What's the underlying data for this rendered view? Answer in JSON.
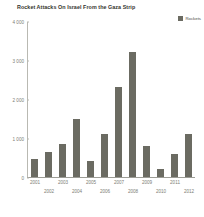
{
  "chart_data": {
    "type": "bar",
    "title": "Rocket Attacks On Israel From the Gaza Strip",
    "xlabel": "",
    "ylabel": "",
    "categories": [
      "2001",
      "2002",
      "2003",
      "2004",
      "2005",
      "2006",
      "2007",
      "2008",
      "2009",
      "2010",
      "2011",
      "2012"
    ],
    "values": [
      450,
      650,
      850,
      1500,
      400,
      1100,
      2300,
      3200,
      800,
      200,
      600,
      1100
    ],
    "series": [
      {
        "name": "Rockets",
        "values": [
          450,
          650,
          850,
          1500,
          400,
          1100,
          2300,
          3200,
          800,
          200,
          600,
          1100
        ]
      }
    ],
    "ylim": [
      0,
      4000
    ],
    "ytick_values": [
      0,
      1000,
      2000,
      3000,
      4000
    ],
    "ytick_labels": [
      "0",
      "1 000",
      "2 000",
      "3 000",
      "4 000"
    ],
    "grid": false,
    "legend_position": "top-right",
    "bar_color": "#6b6b62",
    "axis_color": "#b9b9b2",
    "tick_label_color": "#7d7d76"
  },
  "legend": {
    "entries": [
      {
        "label": "Rockets",
        "color": "#6b6b62",
        "swatch_icon": "square-swatch-icon"
      }
    ]
  },
  "xaxis": {
    "stagger": true,
    "row_top": [
      "2001",
      "2003",
      "2005",
      "2007",
      "2009",
      "2011"
    ],
    "row_bottom": [
      "2002",
      "2004",
      "2006",
      "2008",
      "2010",
      "2012"
    ]
  }
}
